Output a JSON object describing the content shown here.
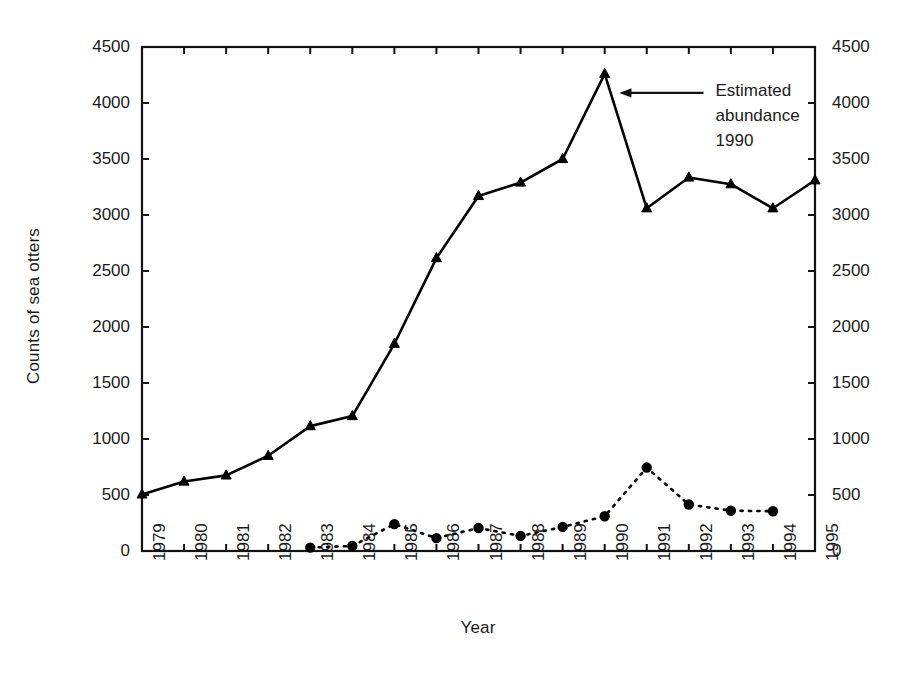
{
  "chart_data": {
    "type": "line",
    "title": "",
    "xlabel": "Year",
    "ylabel": "Counts of sea otters",
    "categories": [
      "1979",
      "1980",
      "1981",
      "1982",
      "1983",
      "1984",
      "1985",
      "1986",
      "1987",
      "1988",
      "1989",
      "1990",
      "1991",
      "1992",
      "1993",
      "1994",
      "1995"
    ],
    "ylim": [
      0,
      4500
    ],
    "yticks": [
      0,
      500,
      1000,
      1500,
      2000,
      2500,
      3000,
      3500,
      4000,
      4500
    ],
    "ytick_labels": [
      "0",
      "500",
      "1000",
      "1500",
      "2000",
      "2500",
      "3000",
      "3500",
      "4000",
      "4500"
    ],
    "right_axis": {
      "ylim": [
        0,
        4500
      ],
      "yticks": [
        0,
        500,
        1000,
        1500,
        2000,
        2500,
        3000,
        3500,
        4000,
        4500
      ],
      "ytick_labels": [
        "0",
        "500",
        "1000",
        "1500",
        "2000",
        "2500",
        "3000",
        "3500",
        "4000",
        "4500"
      ]
    },
    "grid": false,
    "legend": "none",
    "series": [
      {
        "name": "Counts of sea otters",
        "marker": "triangle",
        "linestyle": "solid",
        "color": "#000000",
        "x": [
          "1979",
          "1980",
          "1981",
          "1982",
          "1983",
          "1984",
          "1985",
          "1986",
          "1987",
          "1988",
          "1989",
          "1990",
          "1991",
          "1992",
          "1993",
          "1994",
          "1995"
        ],
        "values": [
          505,
          620,
          675,
          850,
          1115,
          1205,
          1850,
          2615,
          3170,
          3290,
          3500,
          4260,
          3060,
          3335,
          3275,
          3060,
          3310
        ]
      },
      {
        "name": "Secondary counts",
        "marker": "circle",
        "linestyle": "dotted",
        "color": "#000000",
        "x": [
          "1983",
          "1984",
          "1985",
          "1986",
          "1987",
          "1988",
          "1989",
          "1990",
          "1991",
          "1992",
          "1993",
          "1994"
        ],
        "values": [
          30,
          45,
          240,
          115,
          205,
          135,
          215,
          310,
          745,
          415,
          360,
          355
        ]
      }
    ],
    "annotations": [
      {
        "name": "estimated-abundance-1990",
        "lines": [
          "Estimated",
          "abundance",
          "1990"
        ],
        "arrow": {
          "from_year": 1992.35,
          "from_value": 4090,
          "to_year": 1990.35,
          "to_value": 4090
        }
      }
    ]
  }
}
